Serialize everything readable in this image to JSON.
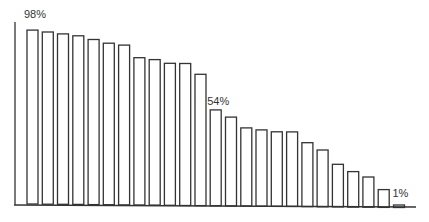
{
  "chart_data": {
    "type": "bar",
    "title": "",
    "xlabel": "",
    "ylabel": "",
    "ylim": [
      0,
      100
    ],
    "grid": false,
    "legend": null,
    "categories": [
      "1",
      "2",
      "3",
      "4",
      "5",
      "6",
      "7",
      "8",
      "9",
      "10",
      "11",
      "12",
      "13",
      "14",
      "15",
      "16",
      "17",
      "18",
      "19",
      "20",
      "21",
      "22",
      "23",
      "24",
      "25"
    ],
    "values": [
      98,
      97,
      96,
      95,
      93,
      91,
      90,
      83,
      82,
      80,
      80,
      74,
      54,
      50,
      44,
      43,
      42,
      42,
      36,
      32,
      24,
      20,
      17,
      10,
      1
    ],
    "annotations": [
      {
        "index": 0,
        "text": "98%"
      },
      {
        "index": 12,
        "text": "54%"
      },
      {
        "index": 24,
        "text": "1%"
      }
    ]
  },
  "style": {
    "bar_fill": "#ffffff",
    "bar_stroke": "#333333",
    "axis_color": "#333333"
  }
}
